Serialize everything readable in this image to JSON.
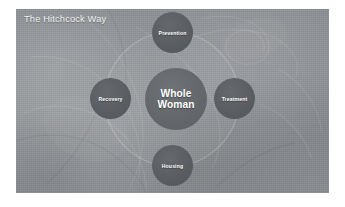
{
  "slide": {
    "title": "The Hitchcock Way",
    "background_color": "#8f9093",
    "page_background": "#ffffff"
  },
  "diagram": {
    "type": "hub-and-spoke",
    "center": {
      "label": "Whole Woman",
      "line1": "Whole",
      "line2": "Woman",
      "color": "#65686c"
    },
    "ring": {
      "visible": true,
      "color": "#7e8185"
    },
    "nodes": [
      {
        "id": "prevention",
        "label": "Prevention",
        "position": "top",
        "color": "#5b5e62"
      },
      {
        "id": "treatment",
        "label": "Treatment",
        "position": "right",
        "color": "#5b5e62"
      },
      {
        "id": "housing",
        "label": "Housing",
        "position": "bottom",
        "color": "#5b5e62"
      },
      {
        "id": "recovery",
        "label": "Recovery",
        "position": "left",
        "color": "#5b5e62"
      }
    ]
  },
  "colors": {
    "text_on_circle": "#ffffff",
    "title_text": "#f2f2f2",
    "slide_fill": "#8f9093"
  }
}
